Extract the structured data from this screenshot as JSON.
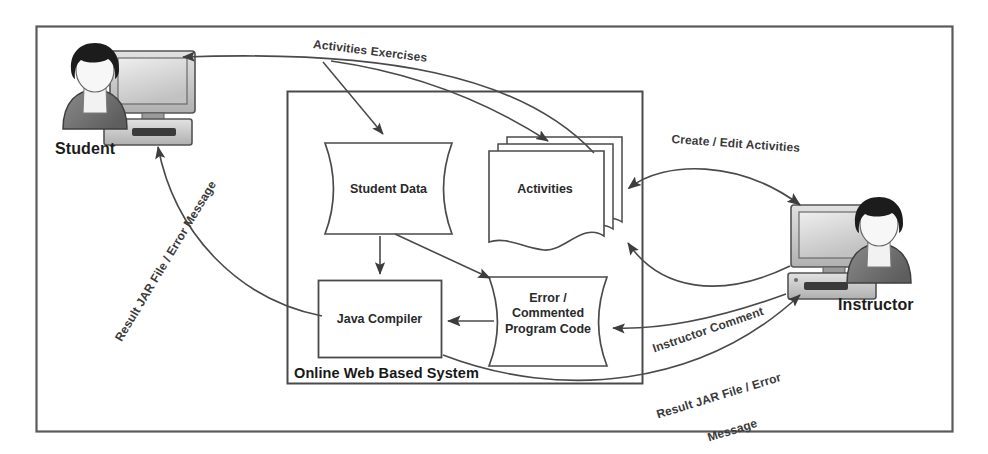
{
  "diagram": {
    "title": "Online Web Based System",
    "type": "data-flow-diagram",
    "frame": {
      "border_color": "#555555"
    },
    "actors": [
      {
        "id": "student",
        "label": "Student",
        "icon": "person-with-computer-icon",
        "side": "left"
      },
      {
        "id": "instructor",
        "label": "Instructor",
        "icon": "person-with-computer-icon",
        "side": "right"
      }
    ],
    "system": {
      "label": "Online Web Based System",
      "nodes": [
        {
          "id": "student-data",
          "label": "Student Data",
          "shape": "curved-sides"
        },
        {
          "id": "activities",
          "label": "Activities",
          "shape": "stacked-documents"
        },
        {
          "id": "java-compiler",
          "label": "Java Compiler",
          "shape": "rectangle"
        },
        {
          "id": "error-code",
          "label": "Error /\nCommented\nProgram Code",
          "shape": "curved-sides"
        }
      ]
    },
    "edges": [
      {
        "id": "activities-exercises",
        "label": "Activities Exercises",
        "from": "activities",
        "to": "student",
        "arrow": "single"
      },
      {
        "id": "activities-to-studentdata",
        "label": "",
        "from": "activities",
        "to": "student-data",
        "arrow": "single"
      },
      {
        "id": "create-edit-activities",
        "label": "Create / Edit Activities",
        "from": "instructor",
        "to": "activities",
        "arrow": "double"
      },
      {
        "id": "result-jar-left",
        "label": "Result JAR File / Error Message",
        "from": "java-compiler",
        "to": "student",
        "arrow": "single"
      },
      {
        "id": "instructor-comment",
        "label": "Instructor Comment",
        "from": "instructor",
        "to": "error-code",
        "arrow": "single"
      },
      {
        "id": "result-jar-right",
        "label": "Result JAR File / Error\nMessage",
        "from": "java-compiler",
        "to": "instructor",
        "arrow": "single"
      },
      {
        "id": "studentdata-to-compiler",
        "label": "",
        "from": "student-data",
        "to": "java-compiler",
        "arrow": "single"
      },
      {
        "id": "studentdata-to-errorcode",
        "label": "",
        "from": "student-data",
        "to": "error-code",
        "arrow": "single"
      },
      {
        "id": "errorcode-to-compiler",
        "label": "",
        "from": "error-code",
        "to": "java-compiler",
        "arrow": "single"
      },
      {
        "id": "errorcode-to-activities",
        "label": "",
        "from": "error-code",
        "to": "activities",
        "arrow": "single"
      }
    ],
    "edge_labels": {
      "activities_exercises": "Activities Exercises",
      "create_edit_activities": "Create / Edit Activities",
      "result_jar_left": "Result JAR File / Error Message",
      "instructor_comment": "Instructor Comment",
      "result_jar_right_line1": "Result JAR File / Error",
      "result_jar_right_line2": "Message"
    },
    "colors": {
      "stroke": "#4a4a4a",
      "text": "#262626",
      "hair": "#1a1a1a",
      "body": "#6f6f6f",
      "monitor_screen": "#d9d9d9",
      "monitor_case": "#c9c9c9",
      "face": "#f4f4f4"
    }
  }
}
